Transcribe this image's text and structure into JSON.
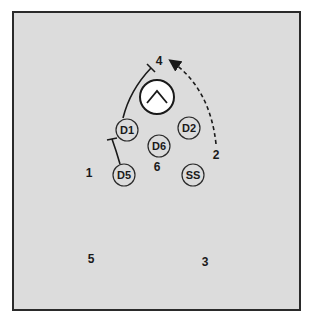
{
  "diagram": {
    "colors": {
      "field": "#dcdcdc",
      "border": "#2a2a2a",
      "ink": "#1a1a1a",
      "ball_fill": "#ffffff"
    },
    "ball": {
      "icon": "caret-up-icon",
      "cx": 157,
      "cy": 97,
      "r": 17
    },
    "defenders": [
      {
        "id": "D1",
        "label": "D1",
        "cx": 127,
        "cy": 130
      },
      {
        "id": "D2",
        "label": "D2",
        "cx": 189,
        "cy": 128
      },
      {
        "id": "D6",
        "label": "D6",
        "cx": 159,
        "cy": 146
      },
      {
        "id": "D5",
        "label": "D5",
        "cx": 124,
        "cy": 175
      },
      {
        "id": "SS",
        "label": "SS",
        "cx": 193,
        "cy": 175
      }
    ],
    "attackers": [
      {
        "label": "1",
        "x": 89,
        "y": 177
      },
      {
        "label": "2",
        "x": 216,
        "y": 159
      },
      {
        "label": "3",
        "x": 205,
        "y": 266
      },
      {
        "label": "4",
        "x": 159,
        "y": 65
      },
      {
        "label": "5",
        "x": 91,
        "y": 263
      },
      {
        "label": "6",
        "x": 157,
        "y": 171
      }
    ],
    "paths": [
      {
        "type": "solid-block",
        "from": "D1",
        "d": "M123,118 Q130,90 151,68"
      },
      {
        "type": "solid-block",
        "from": "D5",
        "d": "M120,164 Q116,150 112,139"
      },
      {
        "type": "dashed-arrow",
        "from": "2",
        "d": "M216,144 Q210,88 171,61"
      }
    ]
  }
}
